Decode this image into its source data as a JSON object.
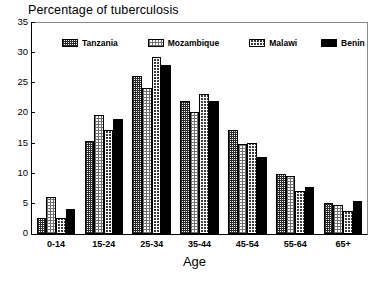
{
  "chart_data": {
    "type": "bar",
    "title": "Percentage of tuberculosis",
    "xlabel": "Age",
    "ylabel": "",
    "ylim": [
      0,
      35
    ],
    "yticks": [
      0,
      5,
      10,
      15,
      20,
      25,
      30,
      35
    ],
    "grid": false,
    "legend_position": "top-inside",
    "categories": [
      "0-14",
      "15-24",
      "25-34",
      "35-44",
      "45-54",
      "55-64",
      "65+"
    ],
    "series": [
      {
        "name": "Tanzania",
        "color": "#2b2b2b",
        "pattern": "dark-crosshatch",
        "values": [
          2.7,
          15.5,
          26.2,
          22.0,
          17.3,
          10.0,
          5.1
        ]
      },
      {
        "name": "Mozambique",
        "color": "#6f6f6f",
        "pattern": "light-dots",
        "values": [
          6.2,
          19.8,
          24.2,
          20.3,
          15.0,
          9.6,
          4.8
        ]
      },
      {
        "name": "Malawi",
        "color": "#3a3a3a",
        "pattern": "dark-dots",
        "values": [
          2.7,
          17.2,
          29.3,
          23.3,
          15.1,
          7.1,
          3.8
        ]
      },
      {
        "name": "Benin",
        "color": "#000000",
        "pattern": "solid",
        "values": [
          4.1,
          19.0,
          28.0,
          22.0,
          12.8,
          7.8,
          5.5
        ]
      }
    ]
  }
}
